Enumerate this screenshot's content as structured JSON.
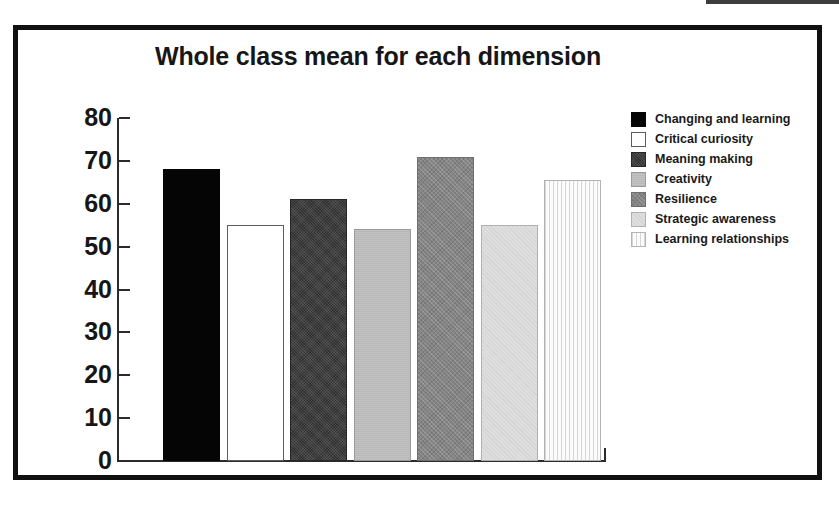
{
  "chart_data": {
    "type": "bar",
    "title": "Whole class mean for each dimension",
    "xlabel": "",
    "ylabel": "",
    "ylim": [
      0,
      80
    ],
    "ytick_step": 10,
    "grid": false,
    "legend_position": "right",
    "categories": [
      "Changing and learning",
      "Critical curiosity",
      "Meaning making",
      "Creativity",
      "Resilience",
      "Strategic awareness",
      "Learning relationships"
    ],
    "values": [
      68,
      55,
      61,
      54,
      71,
      55,
      65.5
    ],
    "ticks": [
      "80",
      "70",
      "60",
      "50",
      "40",
      "30",
      "20",
      "10",
      "0"
    ],
    "tick_values": [
      80,
      70,
      60,
      50,
      40,
      30,
      20,
      10,
      0
    ],
    "bar_styles": [
      "solid-black",
      "white-outline",
      "dark-noise",
      "light-gray",
      "mid-gray-hatch",
      "pale-gray",
      "vertical-stripe"
    ]
  },
  "legend": {
    "items": [
      {
        "label": "Changing and learning",
        "style": "solid-black",
        "color": "#050505"
      },
      {
        "label": "Critical curiosity",
        "style": "white-outline",
        "color": "#ffffff"
      },
      {
        "label": "Meaning making",
        "style": "dark-noise",
        "color": "#2f2f2f"
      },
      {
        "label": "Creativity",
        "style": "light-gray",
        "color": "#c2c2c2"
      },
      {
        "label": "Resilience",
        "style": "mid-gray-hatch",
        "color": "#848484"
      },
      {
        "label": "Strategic awareness",
        "style": "pale-gray",
        "color": "#dedede"
      },
      {
        "label": "Learning relationships",
        "style": "vertical-stripe",
        "color": "#e8e8e8"
      }
    ]
  },
  "frame": {
    "border_color": "#111111",
    "background": "#ffffff"
  }
}
